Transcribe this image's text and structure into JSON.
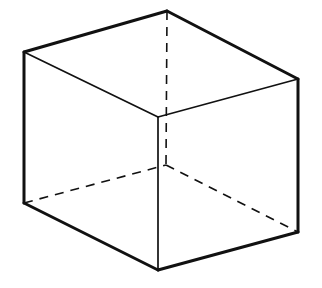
{
  "diagram": {
    "type": "wireframe-cube",
    "stroke_color": "#111111",
    "background": "#ffffff",
    "vertices": {
      "top_back": [
        167,
        11
      ],
      "top_left": [
        24,
        52
      ],
      "top_right": [
        298,
        79
      ],
      "top_front": [
        158,
        117
      ],
      "bottom_left": [
        24,
        203
      ],
      "bottom_right": [
        298,
        232
      ],
      "bottom_front": [
        158,
        270
      ],
      "bottom_back_hidden": [
        166,
        165
      ]
    },
    "visible_edges": [
      [
        "top_left",
        "top_back"
      ],
      [
        "top_back",
        "top_right"
      ],
      [
        "top_left",
        "top_front"
      ],
      [
        "top_front",
        "top_right"
      ],
      [
        "top_left",
        "bottom_left"
      ],
      [
        "top_right",
        "bottom_right"
      ],
      [
        "top_front",
        "bottom_front"
      ],
      [
        "bottom_left",
        "bottom_front"
      ],
      [
        "bottom_front",
        "bottom_right"
      ]
    ],
    "hidden_edges": [
      [
        "top_back",
        "bottom_back_hidden"
      ],
      [
        "bottom_left",
        "bottom_back_hidden"
      ],
      [
        "bottom_back_hidden",
        "bottom_right"
      ]
    ]
  }
}
